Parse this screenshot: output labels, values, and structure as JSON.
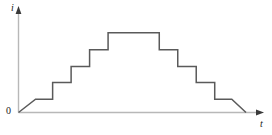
{
  "figure": {
    "title": "",
    "origin_label": "0",
    "y_axis_label": "i",
    "x_axis_label": "t",
    "curve_color": "#5a5a5a",
    "axis_color": "#b8b8b8",
    "background_color": "#ffffff",
    "text_color": "#1a1a1a"
  },
  "chart_data": {
    "type": "line",
    "title": "",
    "xlabel": "t",
    "ylabel": "i",
    "grid": false,
    "legend": false,
    "axis_arrows": true,
    "xlim": [
      0,
      8
    ],
    "ylim": [
      0,
      5
    ],
    "series": [
      {
        "name": "i(t)",
        "color": "#5a5a5a",
        "x": [
          0.0,
          0.6,
          1.2,
          1.2,
          1.85,
          1.85,
          2.5,
          2.5,
          3.15,
          3.15,
          4.95,
          4.95,
          5.6,
          5.6,
          6.25,
          6.25,
          6.9,
          6.9,
          7.5,
          7.5,
          8.0
        ],
        "y": [
          0.0,
          0.75,
          0.75,
          1.7,
          1.7,
          2.6,
          2.6,
          3.55,
          3.55,
          4.5,
          4.5,
          3.55,
          3.55,
          2.6,
          2.6,
          1.7,
          1.7,
          0.75,
          0.75,
          0.75,
          0.0
        ],
        "step_levels": [
          0.75,
          1.7,
          2.6,
          3.55,
          4.5
        ],
        "peak_value": 4.5,
        "peak_x_range": [
          3.15,
          4.95
        ]
      }
    ]
  }
}
